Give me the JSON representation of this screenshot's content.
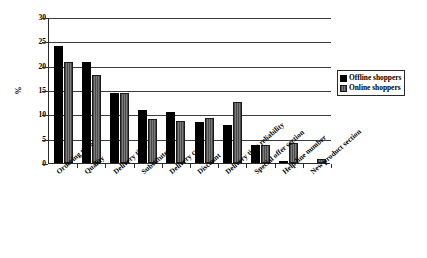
{
  "chart_data": {
    "type": "bar",
    "title": "",
    "xlabel": "",
    "ylabel": "%",
    "ylim": [
      0,
      30
    ],
    "ytick_values": [
      0,
      5,
      10,
      15,
      20,
      25,
      30
    ],
    "ytick_labels": [
      "0",
      "5",
      "10",
      "15",
      "20",
      "25",
      "30"
    ],
    "grid": true,
    "legend_position": "upper right (outside plot, right side)",
    "categories": [
      "Ordering time",
      "Quality",
      "Delivery time",
      "Substitutes",
      "Delivery cost",
      "Discount",
      "Delivery time reliability",
      "Special offer section",
      "Help line number",
      "New product section"
    ],
    "series": [
      {
        "name": "Offline shoppers",
        "color": "#000000",
        "values": [
          24.0,
          20.7,
          14.3,
          10.8,
          10.4,
          8.5,
          7.8,
          3.7,
          0.4,
          0.0
        ]
      },
      {
        "name": "Online shoppers",
        "color": "#595959",
        "values": [
          20.8,
          18.0,
          14.3,
          9.0,
          8.6,
          9.3,
          12.5,
          3.6,
          4.2,
          0.9
        ]
      }
    ]
  },
  "legend": {
    "items": [
      {
        "label": "Offline shoppers"
      },
      {
        "label": "Online shoppers"
      }
    ]
  }
}
